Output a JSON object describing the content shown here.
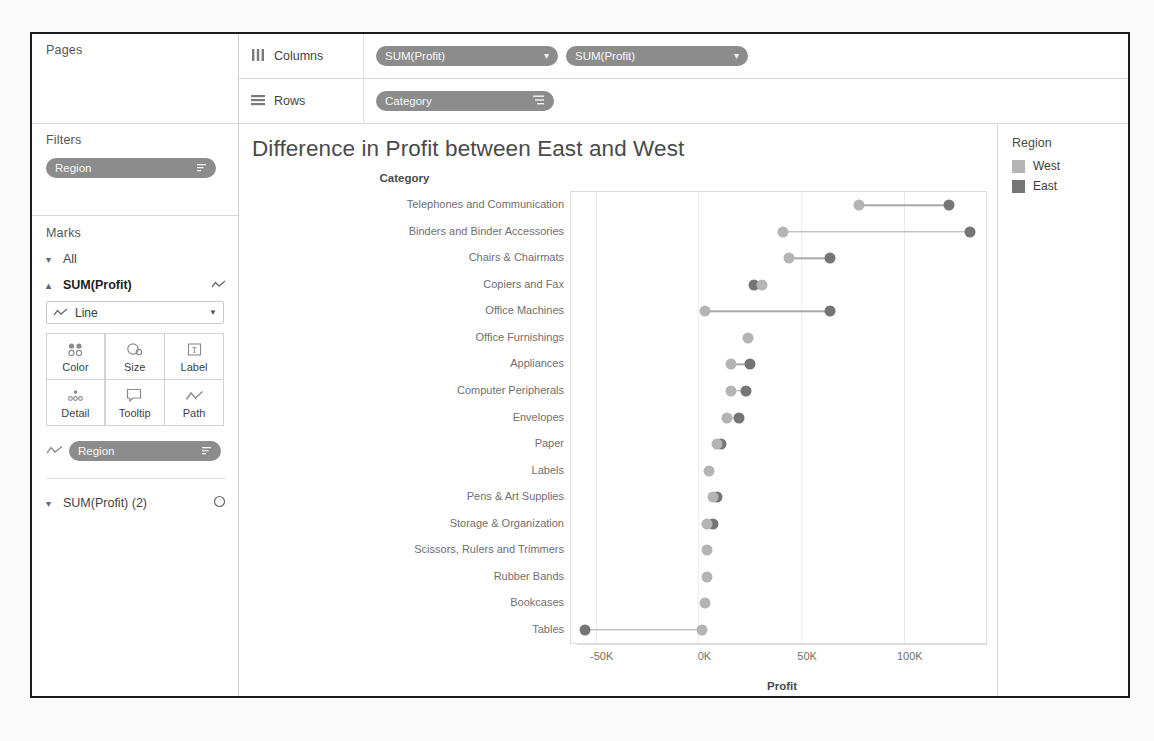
{
  "shelves": {
    "pages_label": "Pages",
    "filters_label": "Filters",
    "filter_pill": "Region",
    "marks_label": "Marks",
    "columns_label": "Columns",
    "rows_label": "Rows",
    "columns_pills": [
      "SUM(Profit)",
      "SUM(Profit)"
    ],
    "rows_pills": [
      "Category"
    ]
  },
  "marks": {
    "all_label": "All",
    "card1_label": "SUM(Profit)",
    "card1_type": "Line",
    "buttons": [
      {
        "label": "Color",
        "icon": "color-icon"
      },
      {
        "label": "Size",
        "icon": "size-icon"
      },
      {
        "label": "Label",
        "icon": "label-icon"
      },
      {
        "label": "Detail",
        "icon": "detail-icon"
      },
      {
        "label": "Tooltip",
        "icon": "tooltip-icon"
      },
      {
        "label": "Path",
        "icon": "path-icon"
      }
    ],
    "encoding_pill": "Region",
    "card2_label": "SUM(Profit) (2)"
  },
  "legend": {
    "title": "Region",
    "items": [
      {
        "label": "West",
        "color": "#b4b4b4"
      },
      {
        "label": "East",
        "color": "#757575"
      }
    ]
  },
  "chart_data": {
    "type": "scatter",
    "title": "Difference in Profit between East and West",
    "xlabel": "Profit",
    "ylabel": "Category",
    "xlim": [
      -62000,
      140000
    ],
    "xticks": [
      -50000,
      0,
      50000,
      100000
    ],
    "xticklabels": [
      "-50K",
      "0K",
      "50K",
      "100K"
    ],
    "grid": true,
    "legend_position": "right",
    "categories": [
      "Telephones and Communication",
      "Binders and Binder Accessories",
      "Chairs & Chairmats",
      "Copiers and Fax",
      "Office Machines",
      "Office Furnishings",
      "Appliances",
      "Computer Peripherals",
      "Envelopes",
      "Paper",
      "Labels",
      "Pens & Art Supplies",
      "Storage & Organization",
      "Scissors, Rulers and Trimmers",
      "Rubber Bands",
      "Bookcases",
      "Tables"
    ],
    "series": [
      {
        "name": "West",
        "color": "#b4b4b4",
        "values": [
          78000,
          41000,
          44000,
          31000,
          3000,
          24000,
          16000,
          16000,
          14000,
          9000,
          5000,
          7000,
          4000,
          4000,
          4000,
          3000,
          2000
        ]
      },
      {
        "name": "East",
        "color": "#757575",
        "values": [
          122000,
          132000,
          64000,
          27000,
          64000,
          null,
          25000,
          23000,
          20000,
          11000,
          null,
          9000,
          7000,
          null,
          null,
          null,
          -55000
        ]
      }
    ]
  }
}
